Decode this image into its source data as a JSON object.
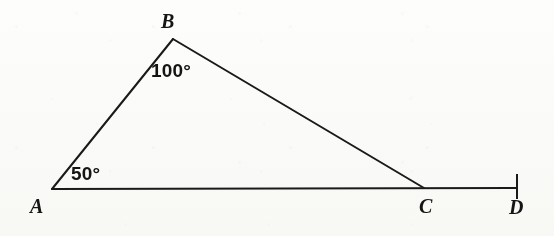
{
  "figure": {
    "kind": "geometry-diagram",
    "width": 554,
    "height": 236,
    "background_color": "#fdfdfc",
    "stroke_color": "#1a1a1a",
    "text_color": "#141414",
    "stroke_width": 2
  },
  "points": [
    {
      "id": "A",
      "label": "A",
      "x": 52,
      "y": 189,
      "label_x": 30,
      "label_y": 196
    },
    {
      "id": "B",
      "label": "B",
      "x": 173,
      "y": 39,
      "label_x": 161,
      "label_y": 11
    },
    {
      "id": "C",
      "label": "C",
      "x": 424,
      "y": 188,
      "label_x": 419,
      "label_y": 196
    },
    {
      "id": "D",
      "label": "D",
      "x": 517,
      "y": 188,
      "label_x": 509,
      "label_y": 197
    }
  ],
  "segments": [
    {
      "id": "AB",
      "from": "A",
      "to": "B",
      "x1": 52,
      "y1": 189,
      "x2": 173,
      "y2": 39
    },
    {
      "id": "BC",
      "from": "B",
      "to": "C",
      "x1": 173,
      "y1": 39,
      "x2": 424,
      "y2": 188
    },
    {
      "id": "AD",
      "from": "A",
      "to": "D",
      "x1": 52,
      "y1": 189,
      "x2": 517,
      "y2": 188
    }
  ],
  "endpoint_ticks": [
    {
      "id": "D-tick",
      "at": "D",
      "x": 517,
      "y1": 174,
      "y2": 199
    }
  ],
  "angles": [
    {
      "id": "angle-B",
      "at": "B",
      "value": 100,
      "label": "100°",
      "label_x": 151,
      "label_y": 61
    },
    {
      "id": "angle-A",
      "at": "A",
      "value": 50,
      "label": "50°",
      "label_x": 71,
      "label_y": 164
    }
  ]
}
